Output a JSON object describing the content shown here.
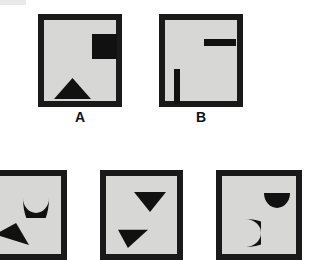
{
  "figure": {
    "title": "",
    "background_color": "#ffffff",
    "panel_fill_color": "#d7d7d6",
    "panel_border_color": "#1a1a1a",
    "shape_color": "#111111",
    "canvas": {
      "width": 318,
      "height": 260
    }
  },
  "panels": [
    {
      "id": "panel-a",
      "label": "A",
      "row": "top",
      "x": 38,
      "y": 14,
      "w": 84,
      "h": 93,
      "label_x": 38,
      "label_y": 110,
      "label_w": 84,
      "clipped": false,
      "shapes": [
        {
          "name": "filled-square",
          "type": "square",
          "x": 48,
          "y": 14,
          "w": 25,
          "h": 25,
          "position": "top-right"
        },
        {
          "name": "up-triangle",
          "type": "triangle-up",
          "x": 10,
          "y": 58,
          "w": 37,
          "h": 21,
          "position": "bottom-left"
        }
      ]
    },
    {
      "id": "panel-b",
      "label": "B",
      "row": "top",
      "x": 159,
      "y": 14,
      "w": 84,
      "h": 93,
      "label_x": 159,
      "label_y": 110,
      "label_w": 84,
      "clipped": false,
      "shapes": [
        {
          "name": "horizontal-bar",
          "type": "bar-horizontal",
          "x": 39,
          "y": 19,
          "w": 32,
          "h": 7,
          "position": "top-right"
        },
        {
          "name": "vertical-bar",
          "type": "bar-vertical",
          "x": 9,
          "y": 49,
          "w": 6,
          "h": 35,
          "position": "bottom-left"
        }
      ]
    },
    {
      "id": "panel-c",
      "label": "",
      "row": "bottom",
      "x": -23,
      "y": 170,
      "w": 90,
      "h": 90,
      "label_x": 0,
      "label_y": 0,
      "label_w": 0,
      "clipped": true,
      "shapes": [
        {
          "name": "crescent-up",
          "type": "crescent-up",
          "x": 40,
          "y": 22,
          "w": 26,
          "h": 20,
          "position": "top-right"
        },
        {
          "name": "left-arrow-triangle",
          "type": "arrow-left",
          "x": 12,
          "y": 47,
          "w": 34,
          "h": 22,
          "position": "bottom-left"
        }
      ]
    },
    {
      "id": "panel-d",
      "label": "",
      "row": "bottom",
      "x": 100,
      "y": 170,
      "w": 83,
      "h": 90,
      "label_x": 0,
      "label_y": 0,
      "label_w": 0,
      "clipped": true,
      "shapes": [
        {
          "name": "down-triangle",
          "type": "triangle-down",
          "x": 28,
          "y": 16,
          "w": 32,
          "h": 20,
          "position": "top-center"
        },
        {
          "name": "right-arrow-triangle",
          "type": "arrow-right",
          "x": 12,
          "y": 46,
          "w": 30,
          "h": 26,
          "position": "bottom-left"
        }
      ]
    },
    {
      "id": "panel-e",
      "label": "",
      "row": "bottom",
      "x": 216,
      "y": 170,
      "w": 86,
      "h": 90,
      "label_x": 0,
      "label_y": 0,
      "label_w": 0,
      "clipped": true,
      "shapes": [
        {
          "name": "half-disc-down",
          "type": "semicircle-down",
          "x": 42,
          "y": 17,
          "w": 26,
          "h": 15,
          "position": "top-right"
        },
        {
          "name": "crescent-left",
          "type": "crescent-left",
          "x": 20,
          "y": 43,
          "w": 19,
          "h": 28,
          "position": "bottom-center"
        }
      ]
    }
  ]
}
